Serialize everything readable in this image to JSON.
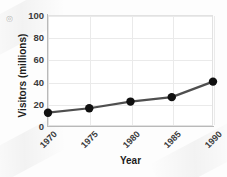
{
  "chart_data": {
    "type": "line",
    "title": "",
    "xlabel": "Year",
    "ylabel": "Visitors (millions)",
    "categories": [
      "1970",
      "1975",
      "1980",
      "1985",
      "1990"
    ],
    "x": [
      1970,
      1975,
      1980,
      1985,
      1990
    ],
    "values": [
      12,
      16,
      22,
      26,
      40
    ],
    "series": [
      {
        "name": "Visitors",
        "values": [
          12,
          16,
          22,
          26,
          40
        ]
      }
    ],
    "xlim": [
      1970,
      1990
    ],
    "ylim": [
      0,
      100
    ],
    "yticks": [
      0,
      20,
      40,
      60,
      80,
      100
    ],
    "ytick_labels": [
      "0",
      "20",
      "40",
      "60",
      "80",
      "100"
    ],
    "xtick_labels": [
      "1970",
      "1975",
      "1980",
      "1985",
      "1990"
    ],
    "xtick_rotation": -45,
    "grid": true,
    "grid_axis": "both",
    "legend": false,
    "legend_position": "none",
    "colors": {
      "line": "#4f4f4f",
      "marker": "#101010",
      "grid": "#eaeaea",
      "axis": "#b9b9b9",
      "text": "#3b3b3b",
      "title_text": "#1c1c1c",
      "plot_background": "#ffffff",
      "figure_background": "#fdfdfd"
    },
    "marker": "circle",
    "marker_size": 4.2,
    "line_width": 2.2
  },
  "watermark": {
    "mark": "◎"
  }
}
